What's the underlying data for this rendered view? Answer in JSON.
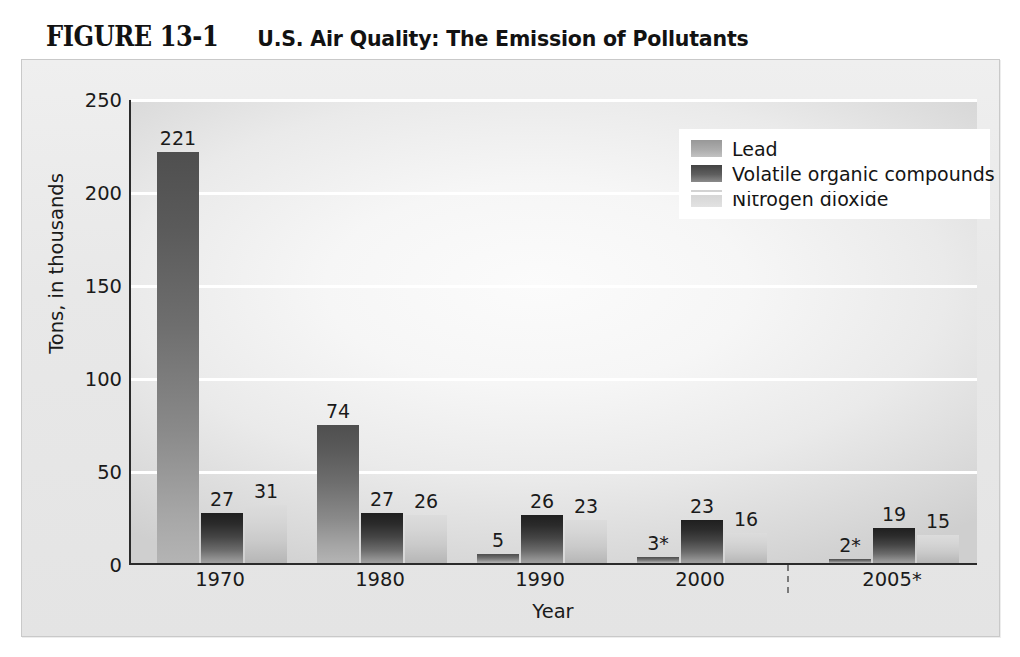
{
  "figure": {
    "number": "FIGURE 13-1",
    "title": "U.S. Air Quality: The Emission of Pollutants"
  },
  "chart_data": {
    "type": "bar",
    "title": "U.S. Air Quality: The Emission of Pollutants",
    "xlabel": "Year",
    "ylabel": "Tons, in thousands",
    "ylim": [
      0,
      250
    ],
    "ytick_labels": [
      "0",
      "50",
      "100",
      "150",
      "200",
      "250"
    ],
    "yticks": [
      0,
      50,
      100,
      150,
      200,
      250
    ],
    "grid": "horizontal",
    "legend_position": "top-right",
    "categories": [
      "1970",
      "1980",
      "1990",
      "2000",
      "2005*"
    ],
    "series": [
      {
        "name": "Lead",
        "color": "#8f8f8f",
        "values": [
          221,
          74,
          5,
          3,
          2
        ],
        "labels": [
          "221",
          "74",
          "5",
          "3*",
          "2*"
        ]
      },
      {
        "name": "Volatile organic compounds",
        "color": "#3a3a3a",
        "values": [
          27,
          27,
          26,
          23,
          19
        ],
        "labels": [
          "27",
          "27",
          "26",
          "23",
          "19"
        ]
      },
      {
        "name": "Nitrogen dioxide",
        "color": "#d4d4d4",
        "values": [
          31,
          26,
          23,
          16,
          15
        ],
        "labels": [
          "31",
          "26",
          "23",
          "16",
          "15"
        ]
      }
    ],
    "annotations": {
      "period_separator": "dashed vertical line between 2000 and 2005*"
    }
  }
}
